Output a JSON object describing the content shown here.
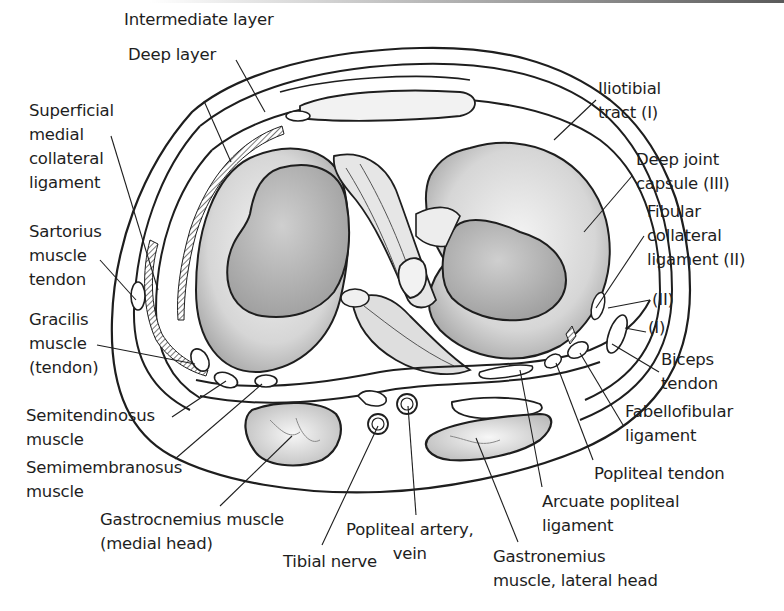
{
  "figure": {
    "colors": {
      "ink": "#1e1e1e",
      "fill_light": "#e9e9e9",
      "fill_mid": "#c9c9c9",
      "fill_dark": "#a8a8a8",
      "background": "#ffffff"
    }
  },
  "labels": [
    {
      "id": "intermediate-layer",
      "text": "Intermediate layer",
      "x": 124,
      "y": 8,
      "align": "left",
      "line": [
        [
          236,
          60
        ],
        [
          265,
          112
        ]
      ]
    },
    {
      "id": "deep-layer",
      "text": "Deep layer",
      "x": 128,
      "y": 43,
      "align": "left",
      "line": [
        [
          204,
          101
        ],
        [
          231,
          162
        ]
      ]
    },
    {
      "id": "superficial-mcl",
      "text": "Superficial\nmedial\ncollateral\nligament",
      "x": 29,
      "y": 99,
      "align": "left",
      "line": [
        [
          111,
          136
        ],
        [
          158,
          290
        ]
      ]
    },
    {
      "id": "sartorius-tendon",
      "text": "Sartorius\nmuscle\ntendon",
      "x": 29,
      "y": 220,
      "align": "left",
      "line": [
        [
          100,
          260
        ],
        [
          136,
          300
        ]
      ]
    },
    {
      "id": "gracilis-tendon",
      "text": "Gracilis\nmuscle\n(tendon)",
      "x": 29,
      "y": 308,
      "align": "left",
      "line": [
        [
          97,
          345
        ],
        [
          195,
          364
        ]
      ]
    },
    {
      "id": "semitendinosus",
      "text": "Semitendinosus\nmuscle",
      "x": 26,
      "y": 404,
      "align": "left",
      "line": [
        [
          172,
          417
        ],
        [
          226,
          381
        ]
      ]
    },
    {
      "id": "semimembranosus",
      "text": "Semimembranosus\nmuscle",
      "x": 26,
      "y": 456,
      "align": "left",
      "line": [
        [
          175,
          459
        ],
        [
          262,
          384
        ]
      ]
    },
    {
      "id": "gastrocnemius-medial",
      "text": "Gastrocnemius muscle\n(medial head)",
      "x": 100,
      "y": 508,
      "align": "left",
      "line": [
        [
          220,
          506
        ],
        [
          292,
          436
        ]
      ]
    },
    {
      "id": "tibial-nerve",
      "text": "Tibial nerve",
      "x": 283,
      "y": 550,
      "align": "left",
      "line": [
        [
          322,
          545
        ],
        [
          378,
          426
        ]
      ]
    },
    {
      "id": "popliteal-artery-vein",
      "text": "Popliteal artery,\nvein",
      "x": 346,
      "y": 518,
      "align": "center",
      "line": [
        [
          416,
          515
        ],
        [
          408,
          406
        ]
      ]
    },
    {
      "id": "gastrocnemius-lateral",
      "text": "Gastronemius\nmuscle, lateral head",
      "x": 493,
      "y": 545,
      "align": "left",
      "line": [
        [
          518,
          542
        ],
        [
          476,
          438
        ]
      ]
    },
    {
      "id": "arcuate-popliteal",
      "text": "Arcuate popliteal\nligament",
      "x": 542,
      "y": 490,
      "align": "left",
      "line": [
        [
          542,
          487
        ],
        [
          520,
          370
        ]
      ]
    },
    {
      "id": "popliteal-tendon",
      "text": "Popliteal tendon",
      "x": 594,
      "y": 462,
      "align": "left",
      "line": [
        [
          593,
          460
        ],
        [
          556,
          363
        ]
      ]
    },
    {
      "id": "fabellofibular",
      "text": "Fabellofibular\nligament",
      "x": 625,
      "y": 400,
      "align": "left",
      "line": [
        [
          623,
          425
        ],
        [
          580,
          353
        ]
      ]
    },
    {
      "id": "biceps-tendon",
      "text": "Biceps\ntendon",
      "x": 661,
      "y": 348,
      "align": "left",
      "line": [
        [
          659,
          372
        ],
        [
          612,
          344
        ]
      ]
    },
    {
      "id": "layer-i-lower",
      "text": "(I)",
      "x": 648,
      "y": 316,
      "align": "left",
      "line": [
        [
          646,
          332
        ],
        [
          625,
          328
        ]
      ]
    },
    {
      "id": "layer-ii-lower",
      "text": "(II)",
      "x": 652,
      "y": 288,
      "align": "left",
      "line": [
        [
          650,
          300
        ],
        [
          608,
          308
        ]
      ]
    },
    {
      "id": "fibular-collateral",
      "text": "Fibular\ncollateral\nligament (II)",
      "x": 647,
      "y": 200,
      "align": "left",
      "line": [
        [
          644,
          236
        ],
        [
          596,
          308
        ]
      ]
    },
    {
      "id": "deep-joint-capsule",
      "text": "Deep joint\ncapsule (III)",
      "x": 636,
      "y": 148,
      "align": "left",
      "line": [
        [
          632,
          176
        ],
        [
          584,
          232
        ]
      ]
    },
    {
      "id": "iliotibial-tract",
      "text": "Iliotibial\ntract (I)",
      "x": 598,
      "y": 77,
      "align": "left",
      "line": [
        [
          596,
          100
        ],
        [
          554,
          140
        ]
      ]
    }
  ]
}
